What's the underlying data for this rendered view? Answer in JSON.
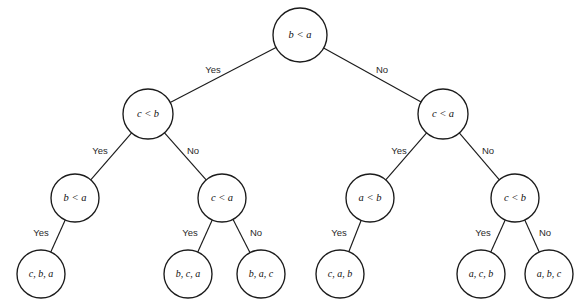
{
  "diagram": {
    "type": "decision-tree",
    "title": "",
    "edge_labels": {
      "yes": "Yes",
      "no": "No"
    },
    "colors": {
      "stroke": "#1b1b1b",
      "fill": "#ffffff",
      "text": "#111111"
    },
    "nodes": [
      {
        "id": "n0",
        "label": "b < a",
        "kind": "decision",
        "cx": 300,
        "cy": 35,
        "r": 27
      },
      {
        "id": "n1",
        "label": "c < b",
        "kind": "decision",
        "cx": 148,
        "cy": 114,
        "r": 25
      },
      {
        "id": "n2",
        "label": "c < a",
        "kind": "decision",
        "cx": 443,
        "cy": 114,
        "r": 25
      },
      {
        "id": "n3",
        "label": "b < a",
        "kind": "decision",
        "cx": 75,
        "cy": 198,
        "r": 24
      },
      {
        "id": "n4",
        "label": "c < a",
        "kind": "decision",
        "cx": 222,
        "cy": 198,
        "r": 24
      },
      {
        "id": "n5",
        "label": "a < b",
        "kind": "decision",
        "cx": 370,
        "cy": 198,
        "r": 24
      },
      {
        "id": "n6",
        "label": "c < b",
        "kind": "decision",
        "cx": 515,
        "cy": 198,
        "r": 24
      },
      {
        "id": "l0",
        "label": "c, b, a",
        "kind": "leaf",
        "cx": 41,
        "cy": 274,
        "r": 24
      },
      {
        "id": "l1",
        "label": "b, c, a",
        "kind": "leaf",
        "cx": 188,
        "cy": 274,
        "r": 24
      },
      {
        "id": "l2",
        "label": "b, a, c",
        "kind": "leaf",
        "cx": 261,
        "cy": 274,
        "r": 24
      },
      {
        "id": "l3",
        "label": "c, a, b",
        "kind": "leaf",
        "cx": 340,
        "cy": 274,
        "r": 24
      },
      {
        "id": "l4",
        "label": "a, c, b",
        "kind": "leaf",
        "cx": 481,
        "cy": 274,
        "r": 24
      },
      {
        "id": "l5",
        "label": "a, b, c",
        "kind": "leaf",
        "cx": 549,
        "cy": 274,
        "r": 24
      }
    ],
    "edges": [
      {
        "from": "n0",
        "to": "n1",
        "label": "Yes",
        "lx": 213,
        "ly": 70
      },
      {
        "from": "n0",
        "to": "n2",
        "label": "No",
        "lx": 382,
        "ly": 70
      },
      {
        "from": "n1",
        "to": "n3",
        "label": "Yes",
        "lx": 100,
        "ly": 151
      },
      {
        "from": "n1",
        "to": "n4",
        "label": "No",
        "lx": 193,
        "ly": 151
      },
      {
        "from": "n2",
        "to": "n5",
        "label": "Yes",
        "lx": 399,
        "ly": 151
      },
      {
        "from": "n2",
        "to": "n6",
        "label": "No",
        "lx": 488,
        "ly": 151
      },
      {
        "from": "n3",
        "to": "l0",
        "label": "Yes",
        "lx": 41,
        "ly": 233
      },
      {
        "from": "n4",
        "to": "l1",
        "label": "Yes",
        "lx": 190,
        "ly": 233
      },
      {
        "from": "n4",
        "to": "l2",
        "label": "No",
        "lx": 256,
        "ly": 233
      },
      {
        "from": "n5",
        "to": "l3",
        "label": "Yes",
        "lx": 339,
        "ly": 233
      },
      {
        "from": "n6",
        "to": "l4",
        "label": "Yes",
        "lx": 483,
        "ly": 233
      },
      {
        "from": "n6",
        "to": "l5",
        "label": "No",
        "lx": 545,
        "ly": 233
      }
    ]
  }
}
